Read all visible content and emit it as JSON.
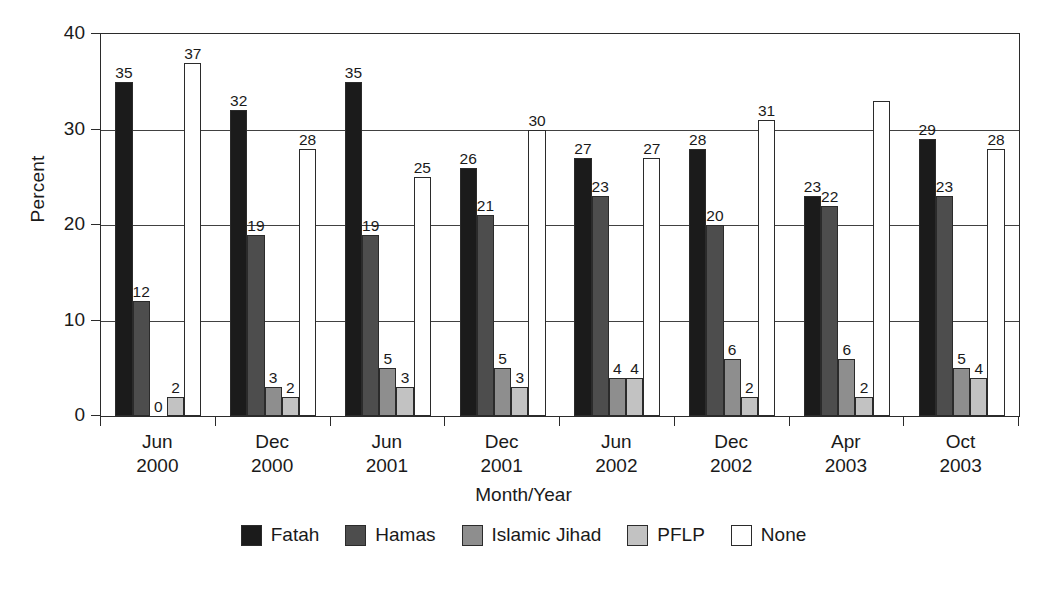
{
  "chart_data": {
    "type": "bar",
    "title": "",
    "subtitle": "",
    "xlabel": "Month/Year",
    "ylabel": "Percent",
    "ylim": [
      0,
      40
    ],
    "yticks": [
      0,
      10,
      20,
      30,
      40
    ],
    "ytick_labels": [
      "0",
      "10",
      "20",
      "30",
      "40"
    ],
    "grid": "horizontal",
    "legend_position": "bottom",
    "categories": [
      "Jun\n2000",
      "Dec\n2000",
      "Jun\n2001",
      "Dec\n2001",
      "Jun\n2002",
      "Dec\n2002",
      "Apr\n2003",
      "Oct\n2003"
    ],
    "category_months": [
      "Jun",
      "Dec",
      "Jun",
      "Dec",
      "Jun",
      "Dec",
      "Apr",
      "Oct"
    ],
    "category_years": [
      "2000",
      "2000",
      "2001",
      "2001",
      "2002",
      "2002",
      "2003",
      "2003"
    ],
    "series": [
      {
        "name": "Fatah",
        "color": "#1b1b1b",
        "values": [
          35,
          32,
          35,
          26,
          27,
          28,
          23,
          29
        ],
        "labels": [
          "35",
          "32",
          "35",
          "26",
          "27",
          "28",
          "23",
          "29"
        ]
      },
      {
        "name": "Hamas",
        "color": "#4d4d4d",
        "values": [
          12,
          19,
          19,
          21,
          23,
          20,
          22,
          23
        ],
        "labels": [
          "12",
          "19",
          "19",
          "21",
          "23",
          "20",
          "22",
          "23"
        ]
      },
      {
        "name": "Islamic Jihad",
        "color": "#8e8e8e",
        "values": [
          0,
          3,
          5,
          5,
          4,
          6,
          6,
          5
        ],
        "labels": [
          "0",
          "3",
          "5",
          "5",
          "4",
          "6",
          "6",
          "5"
        ]
      },
      {
        "name": "PFLP",
        "color": "#c2c2c2",
        "values": [
          2,
          2,
          3,
          3,
          4,
          2,
          2,
          4
        ],
        "labels": [
          "2",
          "2",
          "3",
          "3",
          "4",
          "2",
          "2",
          "4"
        ]
      },
      {
        "name": "None",
        "color": "#ffffff",
        "values": [
          37,
          28,
          25,
          30,
          27,
          31,
          33,
          28
        ],
        "labels": [
          "37",
          "28",
          "25",
          "30",
          "27",
          "31",
          "",
          "28"
        ]
      }
    ]
  },
  "legend": {
    "items": [
      {
        "label": "Fatah"
      },
      {
        "label": "Hamas"
      },
      {
        "label": "Islamic Jihad"
      },
      {
        "label": "PFLP"
      },
      {
        "label": "None"
      }
    ]
  }
}
